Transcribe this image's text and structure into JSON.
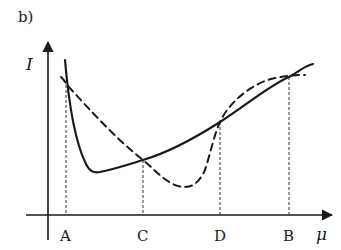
{
  "figure": {
    "panel_label": "b)",
    "y_axis_label": "I",
    "x_axis_label": "μ",
    "points": [
      {
        "label": "A",
        "x": 66
      },
      {
        "label": "C",
        "x": 143
      },
      {
        "label": "D",
        "x": 220
      },
      {
        "label": "B",
        "x": 289
      }
    ],
    "curves": [
      {
        "name": "solid-curve",
        "style": "solid"
      },
      {
        "name": "dashed-curve",
        "style": "dashed"
      }
    ],
    "colors": {
      "ink": "#1a1a1a",
      "background": "#ffffff"
    }
  }
}
